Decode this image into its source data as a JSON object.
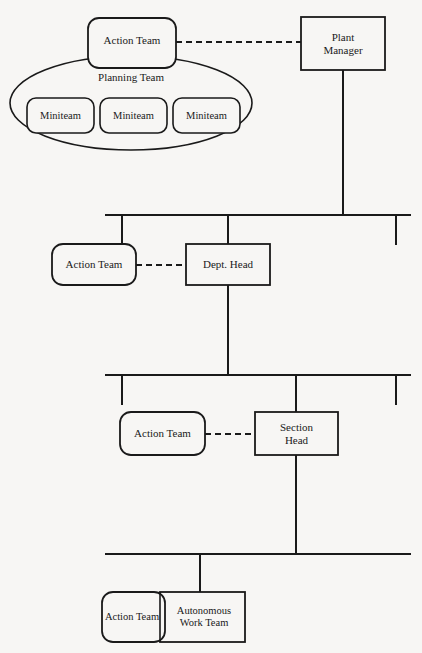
{
  "diagram": {
    "type": "organizational-chart",
    "background_color": "#f7f6f4",
    "line_color": "#1a1a1a",
    "text_color": "#1a1a1a",
    "nodes": {
      "plant_manager": {
        "label": "Plant\nManager",
        "shape": "rectangle"
      },
      "action_team_top": {
        "label": "Action Team",
        "shape": "rounded-rectangle"
      },
      "planning_team": {
        "label": "Planning Team",
        "shape": "ellipse"
      },
      "miniteam_1": {
        "label": "Miniteam",
        "shape": "rounded-rectangle"
      },
      "miniteam_2": {
        "label": "Miniteam",
        "shape": "rounded-rectangle"
      },
      "miniteam_3": {
        "label": "Miniteam",
        "shape": "rounded-rectangle"
      },
      "action_team_dept": {
        "label": "Action Team",
        "shape": "rounded-rectangle"
      },
      "dept_head": {
        "label": "Dept. Head",
        "shape": "rectangle"
      },
      "action_team_section": {
        "label": "Action Team",
        "shape": "rounded-rectangle"
      },
      "section_head": {
        "label": "Section\nHead",
        "shape": "rectangle"
      },
      "action_team_bottom": {
        "label": "Action Team",
        "shape": "rounded-rectangle"
      },
      "autonomous_work_team": {
        "label": "Autonomous\nWork Team",
        "shape": "rectangle"
      }
    },
    "connectors": [
      {
        "name": "plant-manager-to-action-team",
        "style": "dashed"
      },
      {
        "name": "dept-head-to-action-team",
        "style": "dashed"
      },
      {
        "name": "section-head-to-action-team",
        "style": "dashed"
      },
      {
        "name": "plant-manager-down-to-bus-1",
        "style": "solid"
      },
      {
        "name": "bus-1",
        "style": "solid"
      },
      {
        "name": "bus-1-to-dept-head",
        "style": "solid"
      },
      {
        "name": "dept-head-down-to-bus-2",
        "style": "solid"
      },
      {
        "name": "bus-2",
        "style": "solid"
      },
      {
        "name": "bus-2-to-section-head",
        "style": "solid"
      },
      {
        "name": "section-head-down-to-bus-3",
        "style": "solid"
      },
      {
        "name": "bus-3",
        "style": "solid"
      },
      {
        "name": "bus-3-to-work-team",
        "style": "solid"
      }
    ]
  }
}
